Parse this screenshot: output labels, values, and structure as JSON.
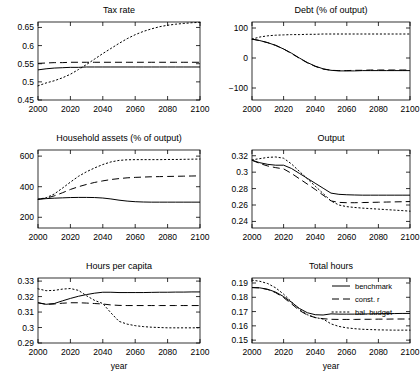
{
  "figure": {
    "xlabel": "year",
    "x_ticks": [
      2000,
      2020,
      2040,
      2060,
      2080,
      2100
    ],
    "xlim": [
      2000,
      2100
    ]
  },
  "legend": {
    "position": "top-right of Total hours panel",
    "entries": [
      {
        "label": "benchmark",
        "style": "solid"
      },
      {
        "label": "const. r",
        "style": "dashed"
      },
      {
        "label": "bal. budget",
        "style": "dotted"
      }
    ]
  },
  "chart_data": [
    {
      "id": "tax-rate",
      "type": "line",
      "title": "Tax rate",
      "xlabel": "",
      "ylabel": "",
      "xlim": [
        2000,
        2100
      ],
      "ylim": [
        0.45,
        0.665
      ],
      "x_ticks": [
        2000,
        2020,
        2040,
        2060,
        2080,
        2100
      ],
      "y_ticks": [
        0.45,
        0.5,
        0.55,
        0.6,
        0.65
      ],
      "y_tick_labels": [
        "0.45",
        "0.5",
        "0.55",
        "0.6",
        "0.65"
      ],
      "grid": false,
      "x": [
        2000,
        2005,
        2010,
        2015,
        2020,
        2025,
        2030,
        2035,
        2040,
        2045,
        2050,
        2055,
        2060,
        2065,
        2070,
        2075,
        2080,
        2085,
        2090,
        2095,
        2100
      ],
      "series": [
        {
          "name": "benchmark",
          "style": "solid",
          "values": [
            0.533,
            0.536,
            0.538,
            0.539,
            0.54,
            0.54,
            0.541,
            0.541,
            0.541,
            0.541,
            0.541,
            0.541,
            0.541,
            0.541,
            0.541,
            0.541,
            0.541,
            0.541,
            0.541,
            0.541,
            0.541
          ]
        },
        {
          "name": "const. r",
          "style": "dashed",
          "values": [
            0.551,
            0.552,
            0.553,
            0.553,
            0.554,
            0.554,
            0.554,
            0.554,
            0.554,
            0.554,
            0.554,
            0.554,
            0.554,
            0.554,
            0.554,
            0.554,
            0.554,
            0.554,
            0.554,
            0.554,
            0.554
          ]
        },
        {
          "name": "bal. budget",
          "style": "dotted",
          "values": [
            0.489,
            0.497,
            0.503,
            0.511,
            0.521,
            0.534,
            0.548,
            0.563,
            0.578,
            0.592,
            0.606,
            0.619,
            0.63,
            0.639,
            0.646,
            0.652,
            0.656,
            0.659,
            0.661,
            0.663,
            0.664
          ]
        }
      ]
    },
    {
      "id": "debt",
      "type": "line",
      "title": "Debt (% of output)",
      "xlabel": "",
      "ylabel": "",
      "xlim": [
        2000,
        2100
      ],
      "ylim": [
        -140,
        120
      ],
      "x_ticks": [
        2000,
        2020,
        2040,
        2060,
        2080,
        2100
      ],
      "y_ticks": [
        -100,
        0,
        100
      ],
      "y_tick_labels": [
        "−100",
        "0",
        "100"
      ],
      "grid": false,
      "x": [
        2000,
        2005,
        2010,
        2015,
        2020,
        2025,
        2030,
        2035,
        2040,
        2045,
        2050,
        2055,
        2060,
        2065,
        2070,
        2075,
        2080,
        2085,
        2090,
        2095,
        2100
      ],
      "series": [
        {
          "name": "benchmark",
          "style": "solid",
          "values": [
            63,
            58,
            51,
            42,
            30,
            16,
            0,
            -15,
            -27,
            -36,
            -41,
            -43,
            -43,
            -43,
            -42,
            -42,
            -42,
            -42,
            -42,
            -42,
            -42
          ]
        },
        {
          "name": "const. r",
          "style": "dashed",
          "values": [
            63,
            58,
            51,
            42,
            30,
            15,
            -1,
            -16,
            -28,
            -37,
            -41,
            -42,
            -42,
            -41,
            -41,
            -40,
            -40,
            -40,
            -40,
            -40,
            -40
          ]
        },
        {
          "name": "bal. budget",
          "style": "dotted",
          "values": [
            63,
            70,
            74,
            76,
            77,
            78,
            78,
            79,
            79,
            80,
            80,
            80,
            80,
            80,
            80,
            80,
            80,
            80,
            80,
            80,
            80
          ]
        }
      ]
    },
    {
      "id": "household-assets",
      "type": "line",
      "title": "Household assets (% of output)",
      "xlabel": "",
      "ylabel": "",
      "xlim": [
        2000,
        2100
      ],
      "ylim": [
        130,
        640
      ],
      "x_ticks": [
        2000,
        2020,
        2040,
        2060,
        2080,
        2100
      ],
      "y_ticks": [
        200,
        400,
        600
      ],
      "y_tick_labels": [
        "200",
        "400",
        "600"
      ],
      "grid": false,
      "x": [
        2000,
        2005,
        2010,
        2015,
        2020,
        2025,
        2030,
        2035,
        2040,
        2045,
        2050,
        2055,
        2060,
        2065,
        2070,
        2075,
        2080,
        2085,
        2090,
        2095,
        2100
      ],
      "series": [
        {
          "name": "benchmark",
          "style": "solid",
          "values": [
            318,
            322,
            325,
            327,
            329,
            330,
            330,
            329,
            326,
            320,
            312,
            306,
            302,
            300,
            299,
            299,
            299,
            299,
            299,
            299,
            299
          ]
        },
        {
          "name": "const. r",
          "style": "dashed",
          "values": [
            318,
            325,
            340,
            360,
            382,
            400,
            415,
            428,
            438,
            447,
            453,
            458,
            461,
            463,
            465,
            466,
            467,
            468,
            469,
            470,
            471
          ]
        },
        {
          "name": "bal. budget",
          "style": "dotted",
          "values": [
            318,
            328,
            352,
            390,
            430,
            468,
            498,
            523,
            545,
            562,
            572,
            576,
            577,
            577,
            577,
            577,
            578,
            578,
            579,
            580,
            581
          ]
        }
      ]
    },
    {
      "id": "output",
      "type": "line",
      "title": "Output",
      "xlabel": "",
      "ylabel": "",
      "xlim": [
        2000,
        2100
      ],
      "ylim": [
        0.232,
        0.327
      ],
      "x_ticks": [
        2000,
        2020,
        2040,
        2060,
        2080,
        2100
      ],
      "y_ticks": [
        0.24,
        0.26,
        0.28,
        0.3,
        0.32
      ],
      "y_tick_labels": [
        "0.24",
        "0.26",
        "0.28",
        "0.3",
        "0.32"
      ],
      "grid": false,
      "x": [
        2000,
        2005,
        2010,
        2015,
        2020,
        2025,
        2030,
        2035,
        2040,
        2045,
        2050,
        2055,
        2060,
        2065,
        2070,
        2075,
        2080,
        2085,
        2090,
        2095,
        2100
      ],
      "series": [
        {
          "name": "benchmark",
          "style": "solid",
          "values": [
            0.3145,
            0.3115,
            0.3095,
            0.3085,
            0.3085,
            0.3045,
            0.2985,
            0.2925,
            0.2865,
            0.2805,
            0.2745,
            0.273,
            0.2725,
            0.2722,
            0.272,
            0.272,
            0.272,
            0.272,
            0.272,
            0.272,
            0.272
          ]
        },
        {
          "name": "const. r",
          "style": "dashed",
          "values": [
            0.3145,
            0.3105,
            0.3075,
            0.3055,
            0.304,
            0.2985,
            0.292,
            0.2855,
            0.279,
            0.272,
            0.265,
            0.2632,
            0.2628,
            0.2628,
            0.263,
            0.2632,
            0.2634,
            0.2636,
            0.2638,
            0.264,
            0.2642
          ]
        },
        {
          "name": "bal. budget",
          "style": "dotted",
          "values": [
            0.315,
            0.3165,
            0.318,
            0.3185,
            0.317,
            0.31,
            0.301,
            0.292,
            0.283,
            0.274,
            0.265,
            0.26,
            0.258,
            0.257,
            0.2562,
            0.2556,
            0.255,
            0.2544,
            0.2538,
            0.2532,
            0.2525
          ]
        }
      ]
    },
    {
      "id": "hours-per-capita",
      "type": "line",
      "title": "Hours per capita",
      "xlabel": "year",
      "ylabel": "",
      "xlim": [
        2000,
        2100
      ],
      "ylim": [
        0.29,
        0.332
      ],
      "x_ticks": [
        2000,
        2020,
        2040,
        2060,
        2080,
        2100
      ],
      "y_ticks": [
        0.29,
        0.3,
        0.31,
        0.32,
        0.33
      ],
      "y_tick_labels": [
        "0.29",
        "0.3",
        "0.31",
        "0.32",
        "0.33"
      ],
      "grid": false,
      "x": [
        2000,
        2005,
        2010,
        2015,
        2020,
        2025,
        2030,
        2035,
        2040,
        2045,
        2050,
        2055,
        2060,
        2065,
        2070,
        2075,
        2080,
        2085,
        2090,
        2095,
        2100
      ],
      "series": [
        {
          "name": "benchmark",
          "style": "solid",
          "values": [
            0.316,
            0.315,
            0.3155,
            0.3172,
            0.3188,
            0.3202,
            0.3213,
            0.3222,
            0.3228,
            0.3228,
            0.3226,
            0.3226,
            0.3226,
            0.3226,
            0.3227,
            0.3228,
            0.3228,
            0.3229,
            0.3229,
            0.323,
            0.323
          ]
        },
        {
          "name": "const. r",
          "style": "dashed",
          "values": [
            0.316,
            0.315,
            0.3152,
            0.3157,
            0.316,
            0.316,
            0.3158,
            0.3155,
            0.3152,
            0.3146,
            0.3143,
            0.3142,
            0.3142,
            0.3142,
            0.3142,
            0.3142,
            0.3142,
            0.3142,
            0.3142,
            0.3142,
            0.3142
          ]
        },
        {
          "name": "bal. budget",
          "style": "dotted",
          "values": [
            0.325,
            0.3238,
            0.324,
            0.3248,
            0.3252,
            0.324,
            0.3205,
            0.3175,
            0.3155,
            0.3095,
            0.304,
            0.3022,
            0.3012,
            0.3006,
            0.3002,
            0.3,
            0.2998,
            0.2998,
            0.2998,
            0.2998,
            0.2998
          ]
        }
      ]
    },
    {
      "id": "total-hours",
      "type": "line",
      "title": "Total hours",
      "xlabel": "year",
      "ylabel": "",
      "xlim": [
        2000,
        2100
      ],
      "ylim": [
        0.148,
        0.1935
      ],
      "x_ticks": [
        2000,
        2020,
        2040,
        2060,
        2080,
        2100
      ],
      "y_ticks": [
        0.15,
        0.16,
        0.17,
        0.18,
        0.19
      ],
      "y_tick_labels": [
        "0.15",
        "0.16",
        "0.17",
        "0.18",
        "0.19"
      ],
      "grid": false,
      "x": [
        2000,
        2005,
        2010,
        2015,
        2020,
        2025,
        2030,
        2035,
        2040,
        2045,
        2050,
        2055,
        2060,
        2065,
        2070,
        2075,
        2080,
        2085,
        2090,
        2095,
        2100
      ],
      "series": [
        {
          "name": "benchmark",
          "style": "solid",
          "values": [
            0.1868,
            0.1866,
            0.1856,
            0.1836,
            0.1805,
            0.1765,
            0.1722,
            0.1692,
            0.1678,
            0.1676,
            0.1684,
            0.1682,
            0.1682,
            0.1682,
            0.1683,
            0.1684,
            0.1685,
            0.1686,
            0.1686,
            0.1687,
            0.1687
          ]
        },
        {
          "name": "const. r",
          "style": "dashed",
          "values": [
            0.1868,
            0.1866,
            0.1854,
            0.1832,
            0.1798,
            0.1754,
            0.1708,
            0.1676,
            0.1658,
            0.165,
            0.1646,
            0.1645,
            0.1645,
            0.1645,
            0.1646,
            0.1646,
            0.1647,
            0.1647,
            0.1648,
            0.1648,
            0.1648
          ]
        },
        {
          "name": "bal. budget",
          "style": "dotted",
          "values": [
            0.192,
            0.1912,
            0.1896,
            0.1866,
            0.1822,
            0.1768,
            0.1714,
            0.1678,
            0.1658,
            0.1648,
            0.1614,
            0.1596,
            0.1586,
            0.158,
            0.1576,
            0.1574,
            0.1572,
            0.1571,
            0.157,
            0.157,
            0.157
          ]
        }
      ]
    }
  ]
}
